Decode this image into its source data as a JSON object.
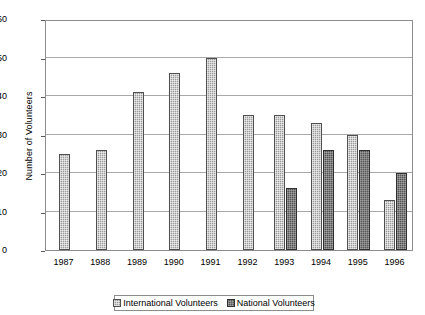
{
  "chart_data": {
    "type": "bar",
    "title": "",
    "xlabel": "",
    "ylabel": "Number of Volunteers",
    "ylim": [
      0,
      60
    ],
    "yticks": [
      0,
      10,
      20,
      30,
      40,
      50,
      60
    ],
    "ytick_labels": [
      "0",
      "10",
      "20",
      "30",
      "40",
      "50",
      "60"
    ],
    "grid": true,
    "legend_position": "bottom",
    "categories": [
      "1987",
      "1988",
      "1989",
      "1990",
      "1991",
      "1992",
      "1993",
      "1994",
      "1995",
      "1996"
    ],
    "series": [
      {
        "name": "International Volunteers",
        "color": "#9a9a9a",
        "values": [
          25,
          26,
          41,
          46,
          50,
          35,
          35,
          33,
          30,
          13
        ]
      },
      {
        "name": "National Volunteers",
        "color": "#555555",
        "values": [
          null,
          null,
          null,
          null,
          null,
          null,
          16,
          26,
          26,
          20
        ]
      }
    ]
  },
  "legend": {
    "entries": [
      {
        "label": "International Volunteers"
      },
      {
        "label": "National Volunteers"
      }
    ]
  }
}
